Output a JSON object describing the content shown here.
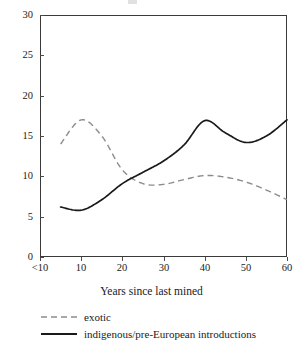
{
  "chart_data": {
    "type": "line",
    "title": "",
    "xlabel": "Years since last mined",
    "ylabel": "",
    "xlim": [
      0,
      60
    ],
    "ylim": [
      0,
      30
    ],
    "grid": false,
    "legend_position": "bottom-left",
    "x_tick_labels": [
      "<10",
      "10",
      "20",
      "30",
      "40",
      "50",
      "60"
    ],
    "x_tick_values": [
      5,
      10,
      20,
      30,
      40,
      50,
      60
    ],
    "y_tick_labels": [
      "0",
      "5",
      "10",
      "15",
      "20",
      "25",
      "30"
    ],
    "y_tick_values": [
      0,
      5,
      10,
      15,
      20,
      25,
      30
    ],
    "x": [
      5,
      10,
      15,
      20,
      25,
      30,
      35,
      40,
      45,
      50,
      55,
      60
    ],
    "series": [
      {
        "name": "exotic",
        "style": "dashed",
        "color": "#8c8c8c",
        "values": [
          14.0,
          17.0,
          15.0,
          10.8,
          9.1,
          9.0,
          9.6,
          10.1,
          9.9,
          9.3,
          8.3,
          7.1
        ]
      },
      {
        "name": "indigenous/pre-European introductions",
        "style": "solid",
        "color": "#1a1a1a",
        "values": [
          6.2,
          5.8,
          7.1,
          9.1,
          10.5,
          11.9,
          13.9,
          16.9,
          15.4,
          14.2,
          15.0,
          17.0
        ]
      }
    ],
    "annotations": []
  },
  "legend": {
    "items": [
      {
        "label": "exotic",
        "sample": "dashed-line-sample"
      },
      {
        "label": "indigenous/pre-European introductions",
        "sample": "solid-line-sample"
      }
    ]
  },
  "axes": {
    "x_title": "Years since last mined"
  }
}
